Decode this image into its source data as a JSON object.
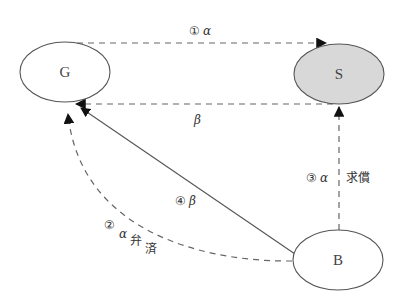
{
  "nodes": {
    "G": {
      "label": "G",
      "cx": 65,
      "cy": 72,
      "rx": 45,
      "ry": 30,
      "fill": "#ffffff"
    },
    "S": {
      "label": "S",
      "cx": 339,
      "cy": 74,
      "rx": 45,
      "ry": 30,
      "fill": "#d8d8d8"
    },
    "B": {
      "label": "B",
      "cx": 338,
      "cy": 260,
      "rx": 45,
      "ry": 30,
      "fill": "#ffffff"
    }
  },
  "edges": {
    "e1": {
      "from": "G",
      "to": "S",
      "style": "dashed",
      "circled": "①",
      "greek": "α",
      "text": ""
    },
    "e_beta": {
      "from": "S",
      "to": "G",
      "style": "dashed",
      "circled": "",
      "greek": "β",
      "text": ""
    },
    "e3": {
      "from": "B",
      "to": "S",
      "style": "dashed",
      "circled": "③",
      "greek": "α",
      "text": "求償"
    },
    "e4": {
      "from": "B",
      "to": "G",
      "style": "solid",
      "circled": "④",
      "greek": "β",
      "text": ""
    },
    "e2": {
      "from": "B",
      "to": "G",
      "style": "dashed-curve",
      "circled": "②",
      "greek": "α",
      "text1": "弁",
      "text2": "済"
    }
  },
  "colors": {
    "stroke": "#555555",
    "arrow": "#111111",
    "shaded": "#d8d8d8"
  }
}
